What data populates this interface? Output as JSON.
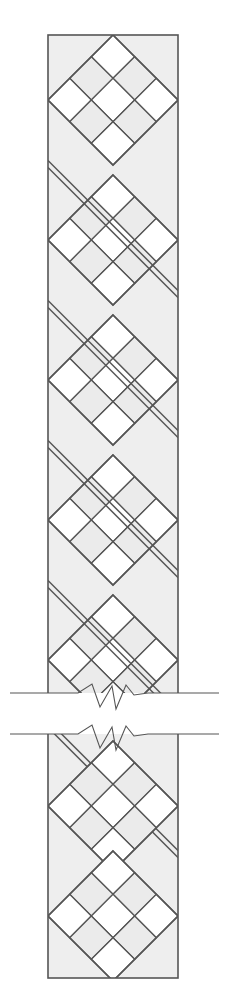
{
  "drawing": {
    "title": "Reinforced concrete column elevation with diagonal lattice reinforcement",
    "type": "engineering-elevation-detail",
    "canvas": {
      "width": 229,
      "height": 1004,
      "background": "#ffffff"
    },
    "colors": {
      "member_fill": "#eeeeee",
      "member_outline": "#555555",
      "lattice_line": "#555555",
      "cell_light": "#ffffff",
      "cell_shaded": "#ebebeb",
      "break_line": "#555555"
    },
    "column": {
      "name": "column-member",
      "left": 48,
      "right": 178,
      "width": 130,
      "top": 35,
      "bottom": 978,
      "outline_width": 1.6
    },
    "lattice": {
      "description": "Chain of rotated-square (diamond) panels each subdivided 3x3 into nine smaller diamonds with alternating light/shaded fill",
      "panel_half_width": 65,
      "panel_pitch": 140,
      "subdivisions": 3,
      "cells_per_panel": 9,
      "shading_pattern": "checkerboard",
      "upper_segment": {
        "name": "upper-lattice-segment",
        "panel_centers_y": [
          100,
          240,
          380,
          520,
          660
        ],
        "panel_count": 5,
        "has_separator_slashes": true,
        "separator_slash_gap": 7
      },
      "lower_segment": {
        "name": "lower-lattice-segment",
        "panel_centers_y": [
          806,
          916
        ],
        "panel_count": 2,
        "has_separator_slashes": false
      }
    },
    "break_symbols": [
      {
        "name": "upper-break-line",
        "y": 693,
        "x_start": 10,
        "x_end": 219,
        "style": "zigzag-short-break",
        "zigzag_center_x": 114
      },
      {
        "name": "lower-break-line",
        "y": 734,
        "x_start": 10,
        "x_end": 219,
        "style": "zigzag-short-break",
        "zigzag_center_x": 114
      }
    ],
    "omitted_region": {
      "name": "omitted-length-gap",
      "top": 693,
      "bottom": 734,
      "note": "length omitted between break lines"
    }
  }
}
